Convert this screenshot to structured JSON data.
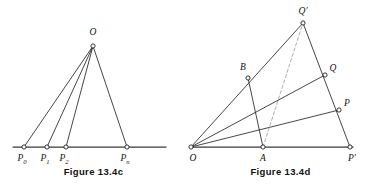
{
  "page": {
    "kind": "textbook-figure-pair",
    "background_color": "#ffffff",
    "ink_color": "#262626",
    "dashed_color": "#9a9a9a",
    "width": 374,
    "height": 188
  },
  "figures": [
    {
      "id": "figure-13-4c",
      "caption": "Figure 13.4c",
      "description": "Apex O joined to four collinear points on a horizontal base line.",
      "points": [
        {
          "name": "O",
          "label": "O",
          "sub": "",
          "x": 93,
          "y": 46,
          "label_x": 93,
          "label_y": 35,
          "anchor": "middle"
        },
        {
          "name": "P0",
          "label": "P",
          "sub": "0",
          "x": 24,
          "y": 147,
          "label_x": 22,
          "label_y": 161,
          "anchor": "middle"
        },
        {
          "name": "P1",
          "label": "P",
          "sub": "1",
          "x": 47,
          "y": 147,
          "label_x": 45,
          "label_y": 161,
          "anchor": "middle"
        },
        {
          "name": "P2",
          "label": "P",
          "sub": "2",
          "x": 66,
          "y": 147,
          "label_x": 64,
          "label_y": 161,
          "anchor": "middle"
        },
        {
          "name": "Pn",
          "label": "P",
          "sub": "n",
          "x": 127,
          "y": 147,
          "label_x": 125,
          "label_y": 161,
          "anchor": "middle"
        }
      ],
      "base_line": {
        "x1": 13,
        "y1": 147,
        "x2": 166,
        "y2": 147
      },
      "edges": [
        {
          "name": "edge-O-P0",
          "x1": 93,
          "y1": 46,
          "x2": 24,
          "y2": 147,
          "style": "solid"
        },
        {
          "name": "edge-O-P1",
          "x1": 93,
          "y1": 46,
          "x2": 47,
          "y2": 147,
          "style": "solid"
        },
        {
          "name": "edge-O-P2",
          "x1": 93,
          "y1": 46,
          "x2": 66,
          "y2": 147,
          "style": "solid"
        },
        {
          "name": "edge-O-Pn",
          "x1": 93,
          "y1": 46,
          "x2": 127,
          "y2": 147,
          "style": "solid"
        }
      ]
    },
    {
      "id": "figure-13-4d",
      "caption": "Figure 13.4d",
      "description": "Rays from O through B to Q-prime, through to Q and to P, with base O to P-prime through A; segments B-A, Q-P-prime, P-P-prime and dashed A to Q-prime.",
      "points": [
        {
          "name": "O",
          "label": "O",
          "sub": "",
          "x": 4,
          "y": 147,
          "label_x": 6,
          "label_y": 161,
          "anchor": "middle"
        },
        {
          "name": "Qprime",
          "label": "Q′",
          "sub": "",
          "x": 116,
          "y": 23,
          "label_x": 116,
          "label_y": 14,
          "anchor": "middle"
        },
        {
          "name": "B",
          "label": "B",
          "sub": "",
          "x": 61,
          "y": 78,
          "label_x": 56,
          "label_y": 70,
          "anchor": "middle"
        },
        {
          "name": "Q",
          "label": "Q",
          "sub": "",
          "x": 138,
          "y": 75,
          "label_x": 146,
          "label_y": 71,
          "anchor": "middle"
        },
        {
          "name": "P",
          "label": "P",
          "sub": "",
          "x": 152,
          "y": 110,
          "label_x": 160,
          "label_y": 106,
          "anchor": "middle"
        },
        {
          "name": "A",
          "label": "A",
          "sub": "",
          "x": 76,
          "y": 147,
          "label_x": 76,
          "label_y": 161,
          "anchor": "middle"
        },
        {
          "name": "Pprime",
          "label": "P′",
          "sub": "",
          "x": 163,
          "y": 147,
          "label_x": 165,
          "label_y": 161,
          "anchor": "middle"
        }
      ],
      "base_line": {
        "x1": 4,
        "y1": 147,
        "x2": 166,
        "y2": 147
      },
      "edges": [
        {
          "name": "ray-O-Qprime",
          "x1": 4,
          "y1": 147,
          "x2": 116,
          "y2": 23,
          "style": "solid"
        },
        {
          "name": "ray-O-Q",
          "x1": 4,
          "y1": 147,
          "x2": 138,
          "y2": 75,
          "style": "solid"
        },
        {
          "name": "ray-O-P",
          "x1": 4,
          "y1": 147,
          "x2": 152,
          "y2": 110,
          "style": "solid"
        },
        {
          "name": "edge-Qprime-Pprime",
          "x1": 116,
          "y1": 23,
          "x2": 163,
          "y2": 147,
          "style": "solid"
        },
        {
          "name": "edge-B-A",
          "x1": 61,
          "y1": 78,
          "x2": 76,
          "y2": 147,
          "style": "solid"
        },
        {
          "name": "edge-A-Qprime",
          "x1": 76,
          "y1": 147,
          "x2": 116,
          "y2": 23,
          "style": "dashed"
        }
      ]
    }
  ]
}
